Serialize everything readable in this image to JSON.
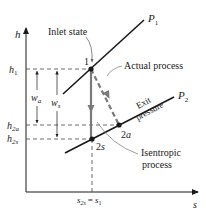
{
  "diagram": {
    "axes": {
      "y_label": "h",
      "x_label": "s"
    },
    "isobars": [
      {
        "label": "P",
        "subscript": "1"
      },
      {
        "label": "P",
        "subscript": "2"
      }
    ],
    "states": [
      {
        "label": "1"
      },
      {
        "label": "2",
        "suffix": "s"
      },
      {
        "label": "2",
        "suffix": "a"
      }
    ],
    "y_ticks": [
      {
        "main": "h",
        "sub": "1"
      },
      {
        "main": "h",
        "sub": "2a"
      },
      {
        "main": "h",
        "sub": "2s"
      }
    ],
    "x_tick": {
      "left_main": "s",
      "left_sub": "2s",
      "equals": "=",
      "right_main": "s",
      "right_sub": "1"
    },
    "work_labels": [
      {
        "main": "w",
        "sub": "a"
      },
      {
        "main": "w",
        "sub": "s"
      }
    ],
    "annotations": {
      "inlet_state": "Inlet state",
      "actual_process": "Actual process",
      "exit_pressure_line1": "Exit",
      "exit_pressure_line2": "pressure",
      "isentropic_line1": "Isentropic",
      "isentropic_line2": "process"
    },
    "colors": {
      "ink": "#1a1a1a",
      "process_gray": "#7a7a7a",
      "dash": "#444444"
    }
  }
}
